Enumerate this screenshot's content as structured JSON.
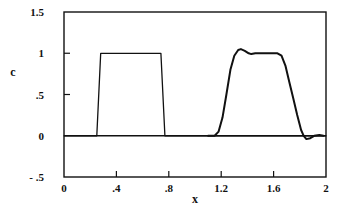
{
  "chart_data": {
    "type": "line",
    "title": "",
    "xlabel": "x",
    "ylabel": "c",
    "xlim": [
      0,
      2
    ],
    "ylim": [
      -0.5,
      1.5
    ],
    "grid": false,
    "legend": null,
    "x_ticks": [
      {
        "value": 0,
        "label": "0"
      },
      {
        "value": 0.4,
        "label": ".4"
      },
      {
        "value": 0.8,
        "label": ".8"
      },
      {
        "value": 1.2,
        "label": "1.2"
      },
      {
        "value": 1.6,
        "label": "1.6"
      },
      {
        "value": 2,
        "label": "2"
      }
    ],
    "y_ticks": [
      {
        "value": 1.5,
        "label": "1.5"
      },
      {
        "value": 1,
        "label": "1"
      },
      {
        "value": 0.5,
        "label": ".5"
      },
      {
        "value": 0,
        "label": "0"
      },
      {
        "value": -0.5,
        "label": "- .5"
      }
    ],
    "series": [
      {
        "name": "initial pulse",
        "stroke_width": 1.3,
        "color": "#111111",
        "x": [
          0,
          0.25,
          0.28,
          0.74,
          0.77,
          2.0
        ],
        "y": [
          0,
          0,
          1.0,
          1.0,
          0,
          0
        ]
      },
      {
        "name": "advected pulse",
        "stroke_width": 2.0,
        "color": "#111111",
        "x": [
          1.1,
          1.15,
          1.18,
          1.21,
          1.24,
          1.27,
          1.3,
          1.33,
          1.35,
          1.38,
          1.41,
          1.43,
          1.46,
          1.55,
          1.63,
          1.66,
          1.69,
          1.72,
          1.75,
          1.78,
          1.81,
          1.83,
          1.85,
          1.88,
          1.91,
          1.95,
          1.98
        ],
        "y": [
          0,
          0,
          0.05,
          0.22,
          0.5,
          0.8,
          0.97,
          1.04,
          1.05,
          1.03,
          1.0,
          0.99,
          1.0,
          1.0,
          1.0,
          0.97,
          0.85,
          0.65,
          0.45,
          0.25,
          0.07,
          0.0,
          -0.04,
          -0.03,
          0.0,
          0.01,
          0.0
        ]
      }
    ]
  }
}
